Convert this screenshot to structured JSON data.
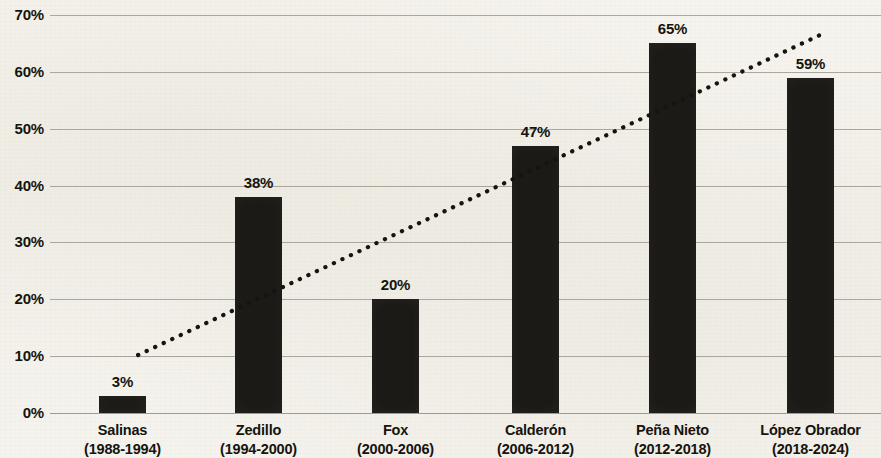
{
  "chart_data": {
    "type": "bar",
    "title": "",
    "subtitle": "",
    "xlabel": "",
    "ylabel": "",
    "categories": [
      "Salinas",
      "Zedillo",
      "Fox",
      "Calderón",
      "Peña Nieto",
      "López Obrador"
    ],
    "category_sublabels": [
      "(1988-1994)",
      "(1994-2000)",
      "(2000-2006)",
      "(2006-2012)",
      "(2012-2018)",
      "(2018-2024)"
    ],
    "values": [
      3,
      38,
      20,
      47,
      65,
      59
    ],
    "value_labels": [
      "3%",
      "38%",
      "20%",
      "47%",
      "65%",
      "59%"
    ],
    "ylim": [
      0,
      70
    ],
    "ytick_values": [
      0,
      10,
      20,
      30,
      40,
      50,
      60,
      70
    ],
    "ytick_labels": [
      "0%",
      "10%",
      "20%",
      "30%",
      "40%",
      "50%",
      "60%",
      "70%"
    ],
    "grid": true,
    "grid_axis": "y",
    "legend": false,
    "legend_position": "none",
    "bar_color": "#1c1a16",
    "background_color": "#f4f2ec",
    "gridline_color": "#9d9a91",
    "text_color": "#15140f",
    "annotations": [
      {
        "type": "trendline",
        "style": "dotted",
        "color": "#15140f",
        "start": {
          "x_category_fraction": 0.08,
          "y_value": 10.2
        },
        "end": {
          "x_category_fraction": 0.96,
          "y_value": 67.0
        }
      }
    ]
  },
  "axis": {
    "y_ticks": [
      {
        "label": "70%",
        "value": 70
      },
      {
        "label": "60%",
        "value": 60
      },
      {
        "label": "50%",
        "value": 50
      },
      {
        "label": "40%",
        "value": 40
      },
      {
        "label": "30%",
        "value": 30
      },
      {
        "label": "20%",
        "value": 20
      },
      {
        "label": "10%",
        "value": 10
      },
      {
        "label": "0%",
        "value": 0
      }
    ]
  },
  "bars": [
    {
      "value_label": "3%",
      "name": "Salinas",
      "years": "(1988-1994)"
    },
    {
      "value_label": "38%",
      "name": "Zedillo",
      "years": "(1994-2000)"
    },
    {
      "value_label": "20%",
      "name": "Fox",
      "years": "(2000-2006)"
    },
    {
      "value_label": "47%",
      "name": "Calderón",
      "years": "(2006-2012)"
    },
    {
      "value_label": "65%",
      "name": "Peña Nieto",
      "years": "(2012-2018)"
    },
    {
      "value_label": "59%",
      "name": "López Obrador",
      "years": "(2018-2024)"
    }
  ]
}
